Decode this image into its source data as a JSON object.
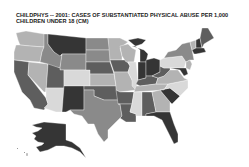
{
  "title": {
    "line1": "CHILDPHYS -- 2001: CASES OF SUBSTANTIATED PHYSICAL ABUSE PER 1,000",
    "line2": "CHILDREN UNDER 18 (CM)"
  },
  "shades": {
    "lightest": "#d9d9d9",
    "light": "#b3b3b3",
    "medium": "#8a8a8a",
    "dark": "#5e5e5e",
    "darkest": "#353535"
  },
  "states": [
    {
      "id": "WA",
      "shade": "light"
    },
    {
      "id": "OR",
      "shade": "light"
    },
    {
      "id": "CA",
      "shade": "dark"
    },
    {
      "id": "NV",
      "shade": "light"
    },
    {
      "id": "ID",
      "shade": "medium"
    },
    {
      "id": "MT",
      "shade": "darkest"
    },
    {
      "id": "WY",
      "shade": "medium"
    },
    {
      "id": "UT",
      "shade": "dark"
    },
    {
      "id": "AZ",
      "shade": "lightest"
    },
    {
      "id": "CO",
      "shade": "lightest"
    },
    {
      "id": "NM",
      "shade": "darkest"
    },
    {
      "id": "ND",
      "shade": "medium"
    },
    {
      "id": "SD",
      "shade": "medium"
    },
    {
      "id": "NE",
      "shade": "dark"
    },
    {
      "id": "KS",
      "shade": "light"
    },
    {
      "id": "OK",
      "shade": "dark"
    },
    {
      "id": "TX",
      "shade": "medium"
    },
    {
      "id": "MN",
      "shade": "light"
    },
    {
      "id": "IA",
      "shade": "dark"
    },
    {
      "id": "MO",
      "shade": "light"
    },
    {
      "id": "AR",
      "shade": "dark"
    },
    {
      "id": "LA",
      "shade": "dark"
    },
    {
      "id": "WI",
      "shade": "light"
    },
    {
      "id": "IL",
      "shade": "lightest"
    },
    {
      "id": "MI",
      "shade": "darkest"
    },
    {
      "id": "IN",
      "shade": "darkest"
    },
    {
      "id": "OH",
      "shade": "darkest"
    },
    {
      "id": "KY",
      "shade": "dark"
    },
    {
      "id": "TN",
      "shade": "light"
    },
    {
      "id": "MS",
      "shade": "lightest"
    },
    {
      "id": "AL",
      "shade": "dark"
    },
    {
      "id": "GA",
      "shade": "light"
    },
    {
      "id": "FL",
      "shade": "darkest"
    },
    {
      "id": "SC",
      "shade": "darkest"
    },
    {
      "id": "NC",
      "shade": "lightest"
    },
    {
      "id": "VA",
      "shade": "light"
    },
    {
      "id": "WV",
      "shade": "dark"
    },
    {
      "id": "PA",
      "shade": "lightest"
    },
    {
      "id": "NY",
      "shade": "medium"
    },
    {
      "id": "VT",
      "shade": "light"
    },
    {
      "id": "NH",
      "shade": "darkest"
    },
    {
      "id": "ME",
      "shade": "dark"
    },
    {
      "id": "MA",
      "shade": "darkest"
    },
    {
      "id": "NJ",
      "shade": "light"
    },
    {
      "id": "MD",
      "shade": "darkest"
    },
    {
      "id": "AK",
      "shade": "darkest"
    },
    {
      "id": "HI",
      "shade": "light"
    }
  ]
}
